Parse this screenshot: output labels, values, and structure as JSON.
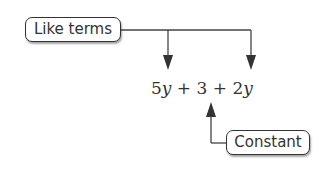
{
  "labels": {
    "like_terms": "Like terms",
    "constant": "Constant"
  },
  "expression": {
    "full": "5y + 3 + 2y",
    "terms": [
      {
        "coef": "5",
        "var": "y"
      },
      {
        "op": "+"
      },
      {
        "coef": "3",
        "var": ""
      },
      {
        "op": "+"
      },
      {
        "coef": "2",
        "var": "y"
      }
    ]
  },
  "colors": {
    "line": "#333333",
    "text": "#333333"
  }
}
